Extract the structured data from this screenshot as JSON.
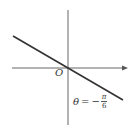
{
  "diagram": {
    "type": "polar-line",
    "origin_label": "O",
    "equation": {
      "lhs": "θ",
      "eq": "=",
      "sign": "−",
      "numerator": "π",
      "denominator": "6"
    },
    "colors": {
      "axis": "#555555",
      "line": "#333333",
      "text": "#333333"
    }
  }
}
